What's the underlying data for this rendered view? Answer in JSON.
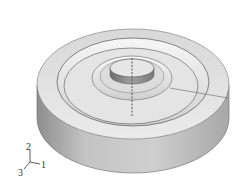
{
  "figure": {
    "colors": {
      "background": "#ffffff",
      "top_face": "#e2e2e2",
      "side_face": "#bdbdbd",
      "edge": "#555555",
      "axis_line": "#333333"
    }
  },
  "triad": {
    "labels": {
      "y": "2",
      "x": "1",
      "z": "3"
    }
  }
}
